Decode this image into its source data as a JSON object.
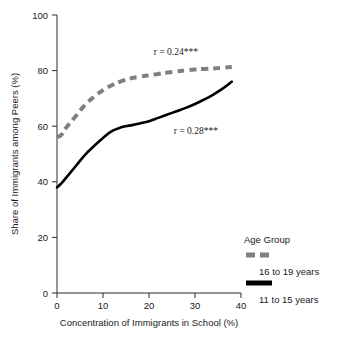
{
  "chart_data": {
    "type": "line",
    "title": "",
    "xlabel": "Concentration of Immigrants in School (%)",
    "ylabel": "Share of Immigrants among Peers (%)",
    "xlim": [
      0,
      40
    ],
    "ylim": [
      0,
      100
    ],
    "xticks": [
      0,
      10,
      20,
      30,
      40
    ],
    "yticks": [
      0,
      20,
      40,
      60,
      80,
      100
    ],
    "xtick_labels": [
      "0",
      "10",
      "20",
      "30",
      "40"
    ],
    "ytick_labels": [
      "0",
      "20",
      "40",
      "60",
      "80",
      "100"
    ],
    "grid": false,
    "legend_position": "right-bottom",
    "series": [
      {
        "name": "16 to 19 years",
        "style": "dashed",
        "color": "#808080",
        "x": [
          0,
          1,
          2,
          4,
          6,
          8,
          10,
          12,
          14,
          16,
          18,
          20,
          22,
          24,
          26,
          28,
          30,
          32,
          34,
          36,
          38
        ],
        "values": [
          56,
          57,
          59.5,
          63.5,
          67.5,
          70.5,
          73,
          74.8,
          76.2,
          77.2,
          77.8,
          78.3,
          78.8,
          79.3,
          79.7,
          80.1,
          80.4,
          80.6,
          80.8,
          81.0,
          81.3
        ]
      },
      {
        "name": "11 to 15 years",
        "style": "solid",
        "color": "#000000",
        "x": [
          0,
          1,
          2,
          4,
          6,
          8,
          10,
          12,
          14,
          16,
          18,
          20,
          22,
          24,
          26,
          28,
          30,
          32,
          34,
          36,
          38
        ],
        "values": [
          38,
          39.5,
          41.5,
          45.5,
          49.5,
          52.8,
          55.8,
          58.3,
          59.6,
          60.3,
          61.0,
          61.8,
          63.0,
          64.2,
          65.4,
          66.6,
          68.0,
          69.6,
          71.4,
          73.5,
          76.0
        ]
      }
    ],
    "annotations": [
      {
        "text": "r = 0.24***",
        "series": "16 to 19 years",
        "x_px": 198,
        "y_px": 55
      },
      {
        "text": "r = 0.28***",
        "series": "11 to 15 years",
        "x_px": 218,
        "y_px": 134
      }
    ]
  },
  "legend": {
    "title": "Age Group",
    "entries": [
      {
        "label": "16 to 19 years",
        "style": "dashed",
        "color": "#808080"
      },
      {
        "label": "11 to 15 years",
        "style": "solid",
        "color": "#000000"
      }
    ]
  }
}
